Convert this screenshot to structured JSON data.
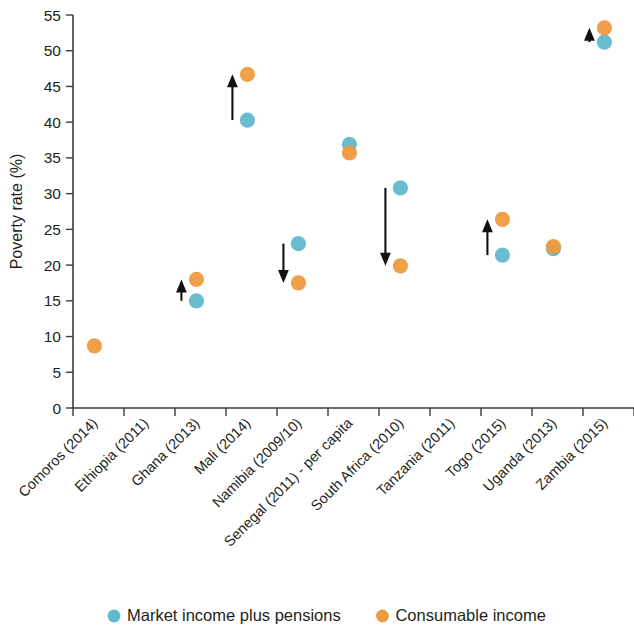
{
  "chart_data": {
    "type": "scatter",
    "title": "",
    "xlabel": "",
    "ylabel": "Poverty rate (%)",
    "ylim": [
      0,
      55
    ],
    "yticks": [
      0,
      5,
      10,
      15,
      20,
      25,
      30,
      35,
      40,
      45,
      50,
      55
    ],
    "grid": false,
    "legend_position": "bottom",
    "categories": [
      "Comoros (2014)",
      "Ethiopia (2011)",
      "Ghana (2013)",
      "Mali (2014)",
      "Namibia (2009/10)",
      "Senegal (2011) - per capita",
      "South Africa (2010)",
      "Tanzania (2011)",
      "Togo (2015)",
      "Uganda (2013)",
      "Zambia (2015)"
    ],
    "series": [
      {
        "name": "Market income plus pensions",
        "color": "#62b8cd",
        "values": [
          null,
          null,
          15.0,
          40.3,
          23.0,
          36.9,
          30.8,
          null,
          21.4,
          22.3,
          51.2
        ]
      },
      {
        "name": "Consumable income",
        "color": "#f09a3e",
        "values": [
          8.7,
          null,
          18.0,
          46.7,
          17.5,
          35.7,
          19.9,
          null,
          26.4,
          22.6,
          53.2
        ]
      }
    ],
    "annotations": [
      {
        "category": "Ghana (2013)",
        "kind": "arrow",
        "direction": "up",
        "from": 15.0,
        "to": 18.0
      },
      {
        "category": "Mali (2014)",
        "kind": "arrow",
        "direction": "up",
        "from": 40.3,
        "to": 46.7
      },
      {
        "category": "Namibia (2009/10)",
        "kind": "arrow",
        "direction": "down",
        "from": 23.0,
        "to": 17.5
      },
      {
        "category": "South Africa (2010)",
        "kind": "arrow",
        "direction": "down",
        "from": 30.8,
        "to": 19.9
      },
      {
        "category": "Togo (2015)",
        "kind": "arrow",
        "direction": "up",
        "from": 21.4,
        "to": 26.4
      },
      {
        "category": "Zambia (2015)",
        "kind": "arrow",
        "direction": "up",
        "from": 51.2,
        "to": 53.2
      }
    ]
  },
  "axis": {
    "y_title": "Poverty rate (%)",
    "y_tick_labels": [
      "0",
      "5",
      "10",
      "15",
      "20",
      "25",
      "30",
      "35",
      "40",
      "45",
      "50",
      "55"
    ]
  },
  "legend": {
    "items": [
      {
        "label": "Market income plus pensions",
        "color": "#62b8cd",
        "marker": "circle-marker"
      },
      {
        "label": "Consumable income",
        "color": "#f09a3e",
        "marker": "circle-marker"
      }
    ]
  }
}
